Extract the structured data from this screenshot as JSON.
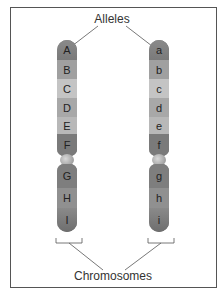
{
  "labels": {
    "alleles": "Alleles",
    "chromosomes": "Chromosomes"
  },
  "chromosome_left": {
    "top_bands": [
      "A",
      "B",
      "C",
      "D",
      "E",
      "F"
    ],
    "bottom_bands": [
      "G",
      "H",
      "I"
    ]
  },
  "chromosome_right": {
    "top_bands": [
      "a",
      "b",
      "c",
      "d",
      "e",
      "f"
    ],
    "bottom_bands": [
      "g",
      "h",
      "i"
    ]
  },
  "colors": {
    "dark_band": "#7a7a7a",
    "mid_band": "#a0a0a0",
    "light_band": "#c8c8c8",
    "line": "#555555"
  }
}
